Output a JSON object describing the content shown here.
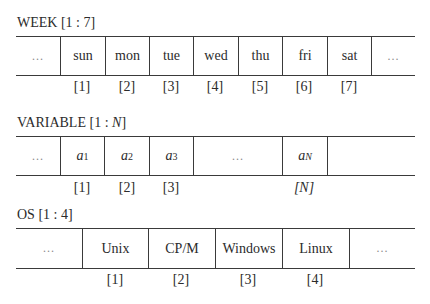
{
  "diagrams": {
    "week": {
      "title_name": "WEEK",
      "title_range": "[1 : 7]",
      "cells": [
        "…",
        "sun",
        "mon",
        "tue",
        "wed",
        "thu",
        "fri",
        "sat",
        "…"
      ],
      "indices": [
        "[1]",
        "[2]",
        "[3]",
        "[4]",
        "[5]",
        "[6]",
        "[7]"
      ]
    },
    "variable": {
      "title_name": "VARIABLE",
      "title_range_prefix": "[1 : ",
      "title_range_var": "N",
      "title_range_suffix": "]",
      "cells": [
        {
          "base": "…"
        },
        {
          "base": "a",
          "sub": "1"
        },
        {
          "base": "a",
          "sub": "2"
        },
        {
          "base": "a",
          "sub": "3"
        },
        {
          "base": "…"
        },
        {
          "base": "a",
          "sub": "N"
        },
        {
          "base": ""
        }
      ],
      "indices": [
        "[1]",
        "[2]",
        "[3]",
        "[N]"
      ]
    },
    "os": {
      "title_name": "OS",
      "title_range": "[1 : 4]",
      "cells": [
        "…",
        "Unix",
        "CP/M",
        "Windows",
        "Linux",
        "…"
      ],
      "indices": [
        "[1]",
        "[2]",
        "[3]",
        "[4]"
      ]
    }
  },
  "colors": {
    "text": "#2b2b2b",
    "lines": "#3a3a3a",
    "ellipsis": "#8a8a8a",
    "background": "#ffffff"
  }
}
